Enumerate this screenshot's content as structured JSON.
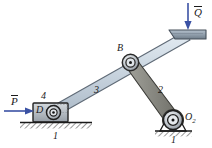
{
  "figure": {
    "background_color": "#ffffff",
    "width": 212,
    "height": 148
  },
  "labels": {
    "force_p": "P",
    "force_q": "Q",
    "joint_b": "B",
    "joint_d": "D",
    "pivot_o2": "O",
    "pivot_o2_sub": "2",
    "link_1_left": "1",
    "link_1_right": "1",
    "link_2": "2",
    "link_3": "3",
    "link_4": "4"
  },
  "colors": {
    "link3_fill": "#c9d6e0",
    "link3_stroke": "#5a6470",
    "link2_fill": "#8c8c86",
    "link2_stroke": "#3d3d3a",
    "platform_fill": "#9aa7b4",
    "platform_stroke": "#4a545f",
    "slider_fill": "#b8bfc6",
    "slider_stroke": "#2b2b2b",
    "arrow_color": "#3b52a4",
    "ground_color": "#1a1a1a",
    "text_color": "#1a1a1a",
    "pin_dark": "#2b2b2b",
    "pin_light": "#d9dde1"
  },
  "elements": {
    "arrow_p_direction": "right",
    "arrow_q_direction": "down",
    "ground_hatch_left": "hatched-ground",
    "ground_hatch_right": "hatched-ground",
    "pin_b": "pin-joint",
    "pin_d": "pin-joint",
    "pin_o2": "pin-joint"
  }
}
